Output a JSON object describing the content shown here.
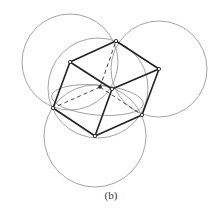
{
  "figure": {
    "caption": "(b)",
    "colors": {
      "edge": "#222222",
      "circle": "#9a9a9a",
      "hidden": "#333333",
      "background": "#ffffff"
    }
  },
  "vertices": [
    {
      "id": "top",
      "x": 116,
      "y": 41
    },
    {
      "id": "upper-left",
      "x": 70,
      "y": 62
    },
    {
      "id": "right",
      "x": 159,
      "y": 69
    },
    {
      "id": "center",
      "x": 112,
      "y": 89
    },
    {
      "id": "hidden",
      "x": 100,
      "y": 87
    },
    {
      "id": "left",
      "x": 53,
      "y": 108
    },
    {
      "id": "lower-right",
      "x": 142,
      "y": 115
    },
    {
      "id": "bottom",
      "x": 95,
      "y": 136
    }
  ],
  "circles": [
    {
      "id": "upper-left-circle",
      "cx": 70,
      "cy": 62,
      "r": 48
    },
    {
      "id": "upper-right-circle",
      "cx": 159,
      "cy": 69,
      "r": 48
    },
    {
      "id": "bottom-circle",
      "cx": 95,
      "cy": 136,
      "r": 51
    },
    {
      "id": "circumcircle",
      "cx": 98,
      "cy": 88,
      "r": 50
    }
  ]
}
